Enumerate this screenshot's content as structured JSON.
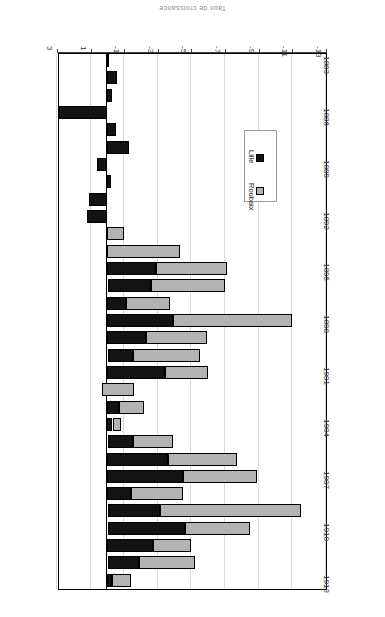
{
  "figure": {
    "title": "Taux de croissance",
    "orientation": "rotated-180",
    "background": "#ffffff"
  },
  "legend": {
    "position": "inside-lower-left",
    "entries": [
      {
        "label": "Roubaix",
        "color": "#b3b3b3",
        "swatch": "gray-square"
      },
      {
        "label": "Lille",
        "color": "#131313",
        "swatch": "black-square"
      }
    ]
  },
  "axes": {
    "value_axis_label": "",
    "category_axis_label": "",
    "value_ticks": [
      "3",
      "1",
      "-1",
      "-3",
      "-5",
      "-7",
      "-9",
      "-11",
      "-13"
    ],
    "category_ticks": [
      "1913",
      "1910",
      "1907",
      "1904",
      "1901",
      "1898",
      "1895",
      "1892",
      "1889",
      "1886",
      "1883"
    ]
  },
  "chart_data": {
    "type": "bar",
    "title": "Taux de croissance",
    "subtype": "horizontal-stacked",
    "xlabel": "",
    "ylabel": "",
    "xlim": [
      3,
      -13
    ],
    "grid": true,
    "legend_position": "inside-lower-left",
    "categories": [
      "1883",
      "1884",
      "1885",
      "1886",
      "1887",
      "1888",
      "1889",
      "1890",
      "1891",
      "1892",
      "1893",
      "1894",
      "1895",
      "1896",
      "1897",
      "1898",
      "1899",
      "1900",
      "1901",
      "1902",
      "1903",
      "1904",
      "1905",
      "1906",
      "1907",
      "1908",
      "1909",
      "1910",
      "1911",
      "1912",
      "1913"
    ],
    "series": [
      {
        "name": "Lille",
        "color": "#131313",
        "values": [
          -0.1,
          -0.6,
          -0.3,
          2.9,
          -0.5,
          -1.3,
          0.6,
          -0.2,
          1.1,
          1.2,
          0.0,
          0.0,
          -2.9,
          -2.6,
          -1.1,
          -3.9,
          -2.3,
          -1.5,
          -3.4,
          0.3,
          -0.7,
          -0.3,
          -1.5,
          -3.6,
          -4.5,
          -1.4,
          -3.1,
          -4.6,
          -2.7,
          -1.9,
          -0.3
        ]
      },
      {
        "name": "Roubaix",
        "color": "#b3b3b3",
        "values": [
          0.0,
          0.0,
          0.0,
          0.0,
          0.0,
          0.0,
          0.0,
          0.0,
          0.0,
          0.0,
          -1.0,
          -4.3,
          -4.2,
          -4.4,
          -2.6,
          -7.1,
          -3.6,
          -4.0,
          -2.6,
          -1.9,
          -1.5,
          -0.5,
          -2.4,
          -4.1,
          -4.4,
          -3.1,
          -8.4,
          -3.9,
          -2.3,
          -3.3,
          -1.1
        ]
      }
    ]
  }
}
